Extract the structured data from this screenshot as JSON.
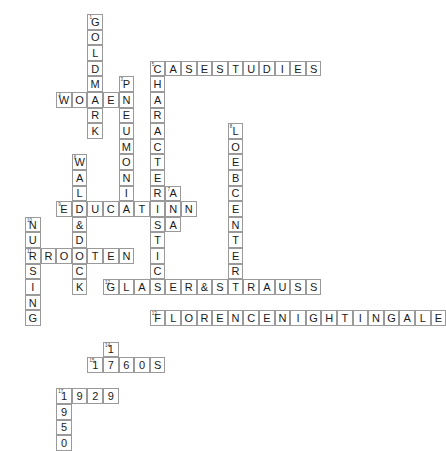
{
  "puzzle": {
    "title": "Crossword Puzzle Grid",
    "cell_size": 15.6,
    "origin_x": 25,
    "origin_y": 14,
    "grid_cols": 26,
    "grid_rows": 26,
    "colors": {
      "cell_border": "#9a9a9a",
      "letter": "#1a1a1a",
      "clue_number": "#3a3a3a",
      "background": "#ffffff"
    },
    "entries": [
      {
        "number": "1",
        "direction": "down",
        "answer": "GOLDMARK",
        "row": 0,
        "col": 4
      },
      {
        "number": "2",
        "direction": "across",
        "answer": "CASESTUDIES",
        "row": 3,
        "col": 8
      },
      {
        "number": "3",
        "direction": "down",
        "answer": "PNEUMONIA",
        "row": 4,
        "col": 6
      },
      {
        "number": "4",
        "direction": "across",
        "answer": "WOMEN",
        "row": 5,
        "col": 2
      },
      {
        "number": "5",
        "direction": "down",
        "answer": "CHARACTERISTICS",
        "row": 3,
        "col": 8
      },
      {
        "number": "6",
        "direction": "down",
        "answer": "WALD&DOCK",
        "row": 9,
        "col": 3
      },
      {
        "number": "7",
        "direction": "down",
        "answer": "ANA",
        "row": 11,
        "col": 9
      },
      {
        "number": "8",
        "direction": "down",
        "answer": "LOEBCENTER",
        "row": 7,
        "col": 13
      },
      {
        "number": "9",
        "direction": "across",
        "answer": "EDUCATION",
        "row": 12,
        "col": 2
      },
      {
        "number": "10",
        "direction": "down",
        "answer": "NURSING",
        "row": 13,
        "col": 0
      },
      {
        "number": "11",
        "direction": "across",
        "answer": "BROOTEN",
        "row": 15,
        "col": 0
      },
      {
        "number": "12",
        "direction": "across",
        "answer": "GLASER&STRAUSS",
        "row": 17,
        "col": 5
      },
      {
        "number": "13",
        "direction": "across",
        "answer": "FLORENCENIGHTINGALE",
        "row": 19,
        "col": 8
      },
      {
        "number": "14",
        "direction": "down",
        "answer": "17",
        "row": 21,
        "col": 5
      },
      {
        "number": "15",
        "direction": "across",
        "answer": "1960S",
        "row": 22,
        "col": 4
      },
      {
        "number": "16",
        "direction": "across",
        "answer": "1929",
        "row": 24,
        "col": 2
      },
      {
        "number": "17",
        "direction": "down",
        "answer": "1950",
        "row": 24,
        "col": 2
      }
    ],
    "cells": [
      {
        "col": 4,
        "row": 0,
        "letter": "G",
        "num": "1"
      },
      {
        "col": 4,
        "row": 1,
        "letter": "O",
        "num": ""
      },
      {
        "col": 4,
        "row": 2,
        "letter": "L",
        "num": ""
      },
      {
        "col": 4,
        "row": 3,
        "letter": "D",
        "num": ""
      },
      {
        "col": 4,
        "row": 4,
        "letter": "M",
        "num": ""
      },
      {
        "col": 4,
        "row": 5,
        "letter": "A",
        "num": ""
      },
      {
        "col": 4,
        "row": 6,
        "letter": "R",
        "num": ""
      },
      {
        "col": 4,
        "row": 7,
        "letter": "K",
        "num": ""
      },
      {
        "col": 8,
        "row": 2,
        "letter": "C",
        "num": "2"
      },
      {
        "col": 9,
        "row": 2,
        "letter": "A",
        "num": ""
      },
      {
        "col": 10,
        "row": 2,
        "letter": "S",
        "num": ""
      },
      {
        "col": 11,
        "row": 2,
        "letter": "E",
        "num": ""
      },
      {
        "col": 12,
        "row": 2,
        "letter": "S",
        "num": ""
      },
      {
        "col": 13,
        "row": 2,
        "letter": "T",
        "num": ""
      },
      {
        "col": 14,
        "row": 2,
        "letter": "U",
        "num": ""
      },
      {
        "col": 15,
        "row": 2,
        "letter": "D",
        "num": ""
      },
      {
        "col": 16,
        "row": 2,
        "letter": "I",
        "num": ""
      },
      {
        "col": 17,
        "row": 2,
        "letter": "E",
        "num": ""
      },
      {
        "col": 18,
        "row": 2,
        "letter": "S",
        "num": ""
      },
      {
        "col": 8,
        "row": 3,
        "letter": "H",
        "num": ""
      },
      {
        "col": 8,
        "row": 4,
        "letter": "A",
        "num": ""
      },
      {
        "col": 8,
        "row": 5,
        "letter": "R",
        "num": ""
      },
      {
        "col": 8,
        "row": 6,
        "letter": "A",
        "num": ""
      },
      {
        "col": 8,
        "row": 7,
        "letter": "C",
        "num": ""
      },
      {
        "col": 8,
        "row": 8,
        "letter": "T",
        "num": ""
      },
      {
        "col": 8,
        "row": 9,
        "letter": "E",
        "num": ""
      },
      {
        "col": 8,
        "row": 10,
        "letter": "R",
        "num": ""
      },
      {
        "col": 8,
        "row": 11,
        "letter": "I",
        "num": ""
      },
      {
        "col": 8,
        "row": 12,
        "letter": "S",
        "num": ""
      },
      {
        "col": 8,
        "row": 13,
        "letter": "T",
        "num": ""
      },
      {
        "col": 8,
        "row": 14,
        "letter": "I",
        "num": ""
      },
      {
        "col": 8,
        "row": 15,
        "letter": "C",
        "num": ""
      },
      {
        "col": 8,
        "row": 16,
        "letter": "S",
        "num": ""
      },
      {
        "col": 6,
        "row": 3,
        "letter": "P",
        "num": "3"
      },
      {
        "col": 6,
        "row": 4,
        "letter": "N",
        "num": ""
      },
      {
        "col": 6,
        "row": 5,
        "letter": "E",
        "num": ""
      },
      {
        "col": 6,
        "row": 6,
        "letter": "U",
        "num": ""
      },
      {
        "col": 6,
        "row": 7,
        "letter": "M",
        "num": ""
      },
      {
        "col": 6,
        "row": 8,
        "letter": "O",
        "num": ""
      },
      {
        "col": 6,
        "row": 9,
        "letter": "N",
        "num": ""
      },
      {
        "col": 6,
        "row": 10,
        "letter": "I",
        "num": ""
      },
      {
        "col": 6,
        "row": 11,
        "letter": "A",
        "num": ""
      },
      {
        "col": 2,
        "row": 4,
        "letter": "W",
        "num": "4"
      },
      {
        "col": 3,
        "row": 4,
        "letter": "O",
        "num": ""
      },
      {
        "col": 5,
        "row": 4,
        "letter": "E",
        "num": ""
      },
      {
        "col": 3,
        "row": 8,
        "letter": "W",
        "num": "6"
      },
      {
        "col": 3,
        "row": 9,
        "letter": "A",
        "num": ""
      },
      {
        "col": 3,
        "row": 10,
        "letter": "L",
        "num": ""
      },
      {
        "col": 3,
        "row": 11,
        "letter": "D",
        "num": ""
      },
      {
        "col": 3,
        "row": 12,
        "letter": "&",
        "num": ""
      },
      {
        "col": 3,
        "row": 13,
        "letter": "D",
        "num": ""
      },
      {
        "col": 3,
        "row": 14,
        "letter": "O",
        "num": ""
      },
      {
        "col": 3,
        "row": 15,
        "letter": "C",
        "num": ""
      },
      {
        "col": 3,
        "row": 16,
        "letter": "K",
        "num": ""
      },
      {
        "col": 2,
        "row": 11,
        "letter": "E",
        "num": "9"
      },
      {
        "col": 4,
        "row": 11,
        "letter": "U",
        "num": ""
      },
      {
        "col": 5,
        "row": 11,
        "letter": "C",
        "num": ""
      },
      {
        "col": 7,
        "row": 11,
        "letter": "T",
        "num": ""
      },
      {
        "col": 9,
        "row": 11,
        "letter": "O",
        "num": ""
      },
      {
        "col": 10,
        "row": 10,
        "letter": "A",
        "num": "7"
      },
      {
        "col": 10,
        "row": 11,
        "letter": "N",
        "num": ""
      },
      {
        "col": 10,
        "row": 12,
        "letter": "A",
        "num": ""
      },
      {
        "col": 13,
        "row": 7,
        "letter": "L",
        "num": "8"
      },
      {
        "col": 13,
        "row": 8,
        "letter": "O",
        "num": ""
      },
      {
        "col": 13,
        "row": 9,
        "letter": "E",
        "num": ""
      },
      {
        "col": 13,
        "row": 10,
        "letter": "B",
        "num": ""
      },
      {
        "col": 13,
        "row": 11,
        "letter": "C",
        "num": ""
      },
      {
        "col": 13,
        "row": 12,
        "letter": "E",
        "num": ""
      },
      {
        "col": 13,
        "row": 13,
        "letter": "N",
        "num": ""
      },
      {
        "col": 13,
        "row": 14,
        "letter": "T",
        "num": ""
      },
      {
        "col": 13,
        "row": 15,
        "letter": "E",
        "num": ""
      },
      {
        "col": 1,
        "row": 12,
        "letter": "N",
        "num": "10"
      },
      {
        "col": 1,
        "row": 13,
        "letter": "U",
        "num": ""
      },
      {
        "col": 1,
        "row": 15,
        "letter": "S",
        "num": ""
      },
      {
        "col": 1,
        "row": 16,
        "letter": "I",
        "num": ""
      },
      {
        "col": 1,
        "row": 17,
        "letter": "N",
        "num": ""
      },
      {
        "col": 1,
        "row": 18,
        "letter": "G",
        "num": ""
      },
      {
        "col": 0,
        "row": 14,
        "letter": "B",
        "num": "11"
      },
      {
        "col": 1,
        "row": 14,
        "letter": "R",
        "num": ""
      },
      {
        "col": 2,
        "row": 14,
        "letter": "O",
        "num": ""
      },
      {
        "col": 4,
        "row": 14,
        "letter": "T",
        "num": ""
      },
      {
        "col": 5,
        "row": 14,
        "letter": "E",
        "num": ""
      },
      {
        "col": 6,
        "row": 14,
        "letter": "N",
        "num": ""
      },
      {
        "col": 4,
        "row": 16,
        "letter": "G",
        "num": "12"
      },
      {
        "col": 5,
        "row": 16,
        "letter": "L",
        "num": ""
      },
      {
        "col": 6,
        "row": 16,
        "letter": "A",
        "num": ""
      },
      {
        "col": 7,
        "row": 16,
        "letter": "S",
        "num": ""
      },
      {
        "col": 9,
        "row": 16,
        "letter": "R",
        "num": ""
      },
      {
        "col": 10,
        "row": 16,
        "letter": "&",
        "num": ""
      },
      {
        "col": 11,
        "row": 16,
        "letter": "S",
        "num": ""
      },
      {
        "col": 12,
        "row": 16,
        "letter": "T",
        "num": ""
      },
      {
        "col": 14,
        "row": 16,
        "letter": "A",
        "num": ""
      },
      {
        "col": 15,
        "row": 16,
        "letter": "U",
        "num": ""
      },
      {
        "col": 16,
        "row": 16,
        "letter": "S",
        "num": ""
      },
      {
        "col": 17,
        "row": 16,
        "letter": "S",
        "num": ""
      },
      {
        "col": 8,
        "row": 17,
        "letter": "O",
        "num": ""
      },
      {
        "col": 8,
        "row": 18,
        "letter": "F",
        "num": "13"
      },
      {
        "col": 9,
        "row": 18,
        "letter": "L",
        "num": ""
      },
      {
        "col": 10,
        "row": 18,
        "letter": "O",
        "num": ""
      },
      {
        "col": 11,
        "row": 18,
        "letter": "R",
        "num": ""
      },
      {
        "col": 12,
        "row": 18,
        "letter": "E",
        "num": ""
      },
      {
        "col": 13,
        "row": 18,
        "letter": "N",
        "num": ""
      },
      {
        "col": 14,
        "row": 18,
        "letter": "C",
        "num": ""
      },
      {
        "col": 15,
        "row": 18,
        "letter": "E",
        "num": ""
      },
      {
        "col": 16,
        "row": 18,
        "letter": "N",
        "num": ""
      },
      {
        "col": 17,
        "row": 18,
        "letter": "I",
        "num": ""
      },
      {
        "col": 18,
        "row": 18,
        "letter": "G",
        "num": ""
      },
      {
        "col": 19,
        "row": 18,
        "letter": "H",
        "num": ""
      },
      {
        "col": 20,
        "row": 18,
        "letter": "T",
        "num": ""
      },
      {
        "col": 21,
        "row": 18,
        "letter": "I",
        "num": ""
      },
      {
        "col": 22,
        "row": 18,
        "letter": "N",
        "num": ""
      },
      {
        "col": 23,
        "row": 18,
        "letter": "G",
        "num": ""
      },
      {
        "col": 24,
        "row": 18,
        "letter": "A",
        "num": ""
      },
      {
        "col": 25,
        "row": 18,
        "letter": "L",
        "num": ""
      },
      {
        "col": 26,
        "row": 18,
        "letter": "E",
        "num": ""
      },
      {
        "col": 8,
        "row": 19,
        "letter": "R",
        "num": ""
      },
      {
        "col": 8,
        "row": 20,
        "letter": "N",
        "num": ""
      },
      {
        "col": 5,
        "row": 20,
        "letter": "1",
        "num": "15"
      },
      {
        "col": 4,
        "row": 21,
        "letter": "1",
        "num": "14"
      },
      {
        "col": 5,
        "row": 21,
        "letter": "9",
        "num": ""
      },
      {
        "col": 6,
        "row": 21,
        "letter": "6",
        "num": ""
      },
      {
        "col": 7,
        "row": 21,
        "letter": "0",
        "num": ""
      },
      {
        "col": 8,
        "row": 21,
        "letter": "S",
        "num": ""
      },
      {
        "col": 5,
        "row": 22,
        "letter": "7",
        "num": ""
      },
      {
        "col": 2,
        "row": 23,
        "letter": "1",
        "num": "16"
      },
      {
        "col": 3,
        "row": 23,
        "letter": "9",
        "num": ""
      },
      {
        "col": 4,
        "row": 23,
        "letter": "2",
        "num": ""
      },
      {
        "col": 5,
        "row": 23,
        "letter": "9",
        "num": ""
      },
      {
        "col": 2,
        "row": 24,
        "letter": "9",
        "num": ""
      },
      {
        "col": 2,
        "row": 25,
        "letter": "5",
        "num": ""
      },
      {
        "col": 2,
        "row": 26,
        "letter": "0",
        "num": ""
      },
      {
        "col": 4,
        "row": 12,
        "letter": "D",
        "num": ""
      },
      {
        "col": 2,
        "row": 12,
        "letter": "N",
        "num": ""
      },
      {
        "col": 1,
        "row": 14,
        "letter": "R",
        "num": ""
      },
      {
        "col": 3,
        "row": 14,
        "letter": "O",
        "num": ""
      },
      {
        "col": 2,
        "row": 15,
        "letter": "",
        "num": ""
      }
    ],
    "cells_final": [
      {
        "col": 4,
        "row": 0,
        "letter": "G",
        "num": "1"
      },
      {
        "col": 4,
        "row": 1,
        "letter": "O",
        "num": ""
      },
      {
        "col": 4,
        "row": 2,
        "letter": "L",
        "num": ""
      },
      {
        "col": 4,
        "row": 3,
        "letter": "D",
        "num": ""
      },
      {
        "col": 6,
        "row": 3,
        "letter": "P",
        "num": "3"
      },
      {
        "col": 8,
        "row": 2,
        "letter": "C",
        "num": "2"
      },
      {
        "col": 9,
        "row": 2,
        "letter": "A",
        "num": ""
      },
      {
        "col": 10,
        "row": 2,
        "letter": "S",
        "num": ""
      },
      {
        "col": 11,
        "row": 2,
        "letter": "E",
        "num": ""
      },
      {
        "col": 12,
        "row": 2,
        "letter": "S",
        "num": ""
      },
      {
        "col": 13,
        "row": 2,
        "letter": "T",
        "num": ""
      },
      {
        "col": 14,
        "row": 2,
        "letter": "U",
        "num": ""
      },
      {
        "col": 15,
        "row": 2,
        "letter": "D",
        "num": ""
      },
      {
        "col": 16,
        "row": 2,
        "letter": "I",
        "num": ""
      },
      {
        "col": 17,
        "row": 2,
        "letter": "E",
        "num": ""
      },
      {
        "col": 18,
        "row": 2,
        "letter": "S",
        "num": ""
      }
    ]
  }
}
